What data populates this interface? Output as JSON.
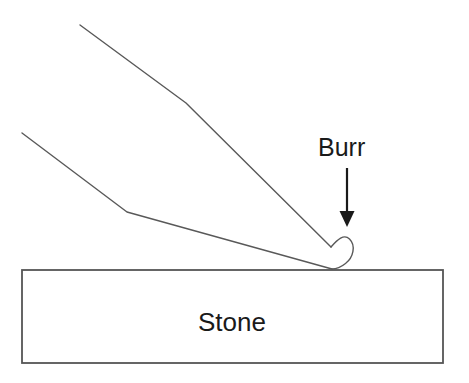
{
  "figure": {
    "background_color": "#ffffff",
    "width": 469,
    "height": 383,
    "labels": {
      "burr": "Burr",
      "stone": "Stone"
    },
    "colors": {
      "line": "#595959",
      "stone_outline": "#555555",
      "stone_fill": "#ffffff",
      "arrow": "#1a1a1a",
      "text": "#1a1a1a"
    },
    "annotation": {
      "arrow_name": "burr-pointer-arrow",
      "arrow_direction": "down"
    },
    "geometry": {
      "blade_upper_path": "M 80,25 L 186,103 L 331,247",
      "blade_lower_path": "M 22,133 L 127,212 L 332,269",
      "burr_hook_path": "M 331,247 C 338,239 345,234 350,240 C 356,247 353,258 345,264 C 340,268 336,269 332,269",
      "arrow_shaft": "M 347,168 L 347,214",
      "arrow_head_points": "340,212 354,212 347,227",
      "stone_rect": {
        "x": 22,
        "y": 270,
        "width": 421,
        "height": 93
      },
      "burr_label_pos": {
        "x": 318,
        "y": 156
      },
      "stone_label_pos": {
        "x": 232,
        "y": 331
      }
    }
  }
}
